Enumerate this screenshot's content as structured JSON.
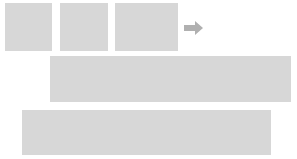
{
  "figure": {
    "background_color": "#ffffff",
    "panel_color": "#d7d7d7",
    "mark_color": "#0b0b0b",
    "arrow_color": "#b0b0b0",
    "width": 297,
    "height": 159
  },
  "arrow": {
    "name": "right-arrow",
    "glyph": "→",
    "label": "",
    "color": "#b0b0b0",
    "x": 184,
    "y": 21,
    "width": 19,
    "height": 14
  },
  "rows": [
    {
      "name": "input-row",
      "label": "",
      "panels": [
        {
          "name": "input-panel-1",
          "label": "",
          "x": 5,
          "y": 3,
          "width": 47,
          "height": 48,
          "cross": null
        },
        {
          "name": "input-panel-2",
          "label": "",
          "x": 60,
          "y": 3,
          "width": 48,
          "height": 48,
          "cross": {
            "name": "cross-mark",
            "center_x": 24,
            "center_y": 24,
            "bar_thickness": 8,
            "vertical_length": 48,
            "horizontal_length": 48,
            "horizontal_offset_y": -2
          }
        },
        {
          "name": "input-panel-3",
          "label": "",
          "x": 115,
          "y": 3,
          "width": 63,
          "height": 48,
          "cross": null
        }
      ]
    },
    {
      "name": "stitched-row-1",
      "label": "",
      "panels": [
        {
          "name": "stitched-panel-1",
          "label": "",
          "x": 50,
          "y": 56,
          "width": 241,
          "height": 46,
          "cross": {
            "name": "cross-mark",
            "center_x": 109,
            "center_y": 23,
            "bar_thickness": 9,
            "vertical_length": 46,
            "horizontal_length": 41,
            "horizontal_offset_y": -1
          }
        }
      ]
    },
    {
      "name": "stitched-row-2",
      "label": "",
      "panels": [
        {
          "name": "stitched-panel-2",
          "label": "",
          "x": 22,
          "y": 110,
          "width": 249,
          "height": 45,
          "cross": {
            "name": "cross-mark",
            "center_x": 193,
            "center_y": 22,
            "bar_thickness": 9,
            "vertical_length": 45,
            "horizontal_length": 41,
            "horizontal_offset_y": -1
          }
        }
      ]
    }
  ]
}
